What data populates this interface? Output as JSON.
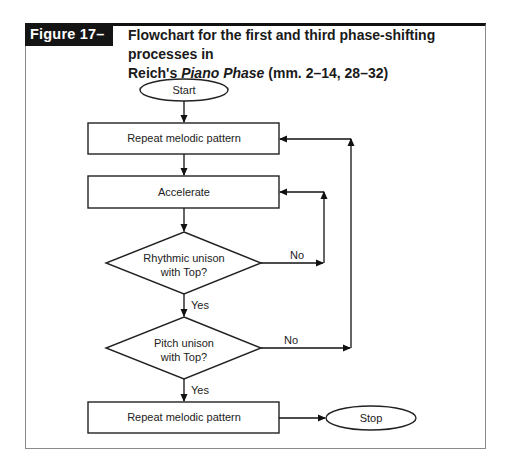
{
  "figure": {
    "label": "Figure 17–1.",
    "caption_line1": "Flowchart for the first and third phase-shifting processes in",
    "caption_line2_prefix": "Reich's ",
    "caption_line2_italic": "Piano Phase",
    "caption_line2_suffix": " (mm. 2–14, 28–32)"
  },
  "flowchart": {
    "start": "Start",
    "step1": "Repeat melodic pattern",
    "step2": "Accelerate",
    "decision1_line1": "Rhythmic unison",
    "decision1_line2": "with Top?",
    "decision2_line1": "Pitch unison",
    "decision2_line2": "with Top?",
    "step3": "Repeat melodic pattern",
    "stop": "Stop",
    "yes": "Yes",
    "no": "No"
  }
}
